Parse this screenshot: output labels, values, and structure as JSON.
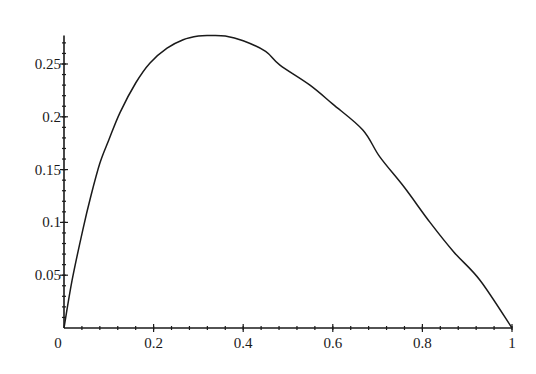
{
  "chart_data": {
    "type": "line",
    "title": "",
    "xlabel": "",
    "ylabel": "",
    "xlim": [
      0,
      1
    ],
    "ylim": [
      0,
      0.277
    ],
    "grid": false,
    "legend": null,
    "x_ticks": [
      {
        "value": 0,
        "label": "0"
      },
      {
        "value": 0.2,
        "label": "0.2"
      },
      {
        "value": 0.4,
        "label": "0.4"
      },
      {
        "value": 0.6,
        "label": "0.6"
      },
      {
        "value": 0.8,
        "label": "0.8"
      },
      {
        "value": 1,
        "label": "1"
      }
    ],
    "x_minor_step": 0.04,
    "y_ticks": [
      {
        "value": 0.05,
        "label": "0.05"
      },
      {
        "value": 0.1,
        "label": "0.1"
      },
      {
        "value": 0.15,
        "label": "0.15"
      },
      {
        "value": 0.2,
        "label": "0.2"
      },
      {
        "value": 0.25,
        "label": "0.25"
      }
    ],
    "y_minor_step": 0.01,
    "series": [
      {
        "name": "f(x)",
        "color": "#1a1a1a",
        "x": [
          0,
          0.018,
          0.042,
          0.06,
          0.08,
          0.1,
          0.125,
          0.16,
          0.192,
          0.23,
          0.266,
          0.3,
          0.326,
          0.36,
          0.4,
          0.45,
          0.482,
          0.549,
          0.6,
          0.667,
          0.705,
          0.76,
          0.817,
          0.87,
          0.929,
          1.0
        ],
        "y": [
          0,
          0.045,
          0.093,
          0.125,
          0.156,
          0.178,
          0.204,
          0.232,
          0.251,
          0.265,
          0.273,
          0.2765,
          0.277,
          0.2765,
          0.272,
          0.262,
          0.249,
          0.23,
          0.212,
          0.1875,
          0.162,
          0.133,
          0.1,
          0.072,
          0.045,
          0
        ]
      }
    ],
    "peak": {
      "x": 0.33,
      "y": 0.277
    }
  }
}
